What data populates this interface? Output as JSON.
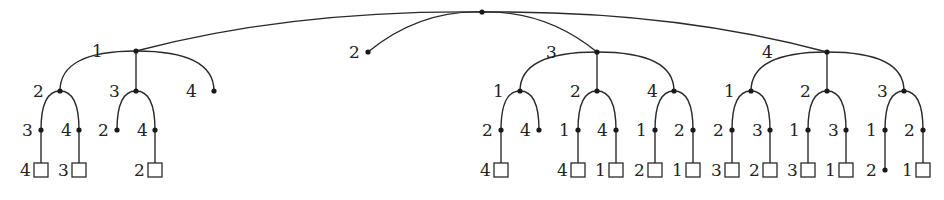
{
  "diagram": {
    "type": "game-tree",
    "style": {
      "line_color": "#2a2a2a",
      "text_color": "#222222",
      "background": "#ffffff"
    },
    "root": {
      "x": 482,
      "y": 12
    },
    "nodes": [
      {
        "id": "n1",
        "parent": "root",
        "label": "1",
        "x": 136,
        "y": 51,
        "kind": "dot",
        "lx": 92,
        "ly": 57
      },
      {
        "id": "n1_2",
        "parent": "n1",
        "label": "2",
        "x": 60,
        "y": 91,
        "kind": "dot",
        "lx": 33,
        "ly": 97
      },
      {
        "id": "n1_2_3",
        "parent": "n1_2",
        "label": "3",
        "x": 41,
        "y": 130,
        "kind": "dot",
        "lx": 22,
        "ly": 136
      },
      {
        "id": "n1_2_3_4",
        "parent": "n1_2_3",
        "label": "4",
        "x": 41,
        "y": 170,
        "kind": "box",
        "lx": 20,
        "ly": 176
      },
      {
        "id": "n1_2_4",
        "parent": "n1_2",
        "label": "4",
        "x": 79,
        "y": 130,
        "kind": "dot",
        "lx": 61,
        "ly": 136
      },
      {
        "id": "n1_2_4_3",
        "parent": "n1_2_4",
        "label": "3",
        "x": 79,
        "y": 170,
        "kind": "box",
        "lx": 58,
        "ly": 176
      },
      {
        "id": "n1_3",
        "parent": "n1",
        "label": "3",
        "x": 136,
        "y": 91,
        "kind": "dot",
        "lx": 109,
        "ly": 97
      },
      {
        "id": "n1_3_2",
        "parent": "n1_3",
        "label": "2",
        "x": 117,
        "y": 130,
        "kind": "dot",
        "lx": 98,
        "ly": 136
      },
      {
        "id": "n1_3_4",
        "parent": "n1_3",
        "label": "4",
        "x": 155,
        "y": 130,
        "kind": "dot",
        "lx": 137,
        "ly": 136
      },
      {
        "id": "n1_3_4_2",
        "parent": "n1_3_4",
        "label": "2",
        "x": 155,
        "y": 170,
        "kind": "box",
        "lx": 134,
        "ly": 176
      },
      {
        "id": "n1_4",
        "parent": "n1",
        "label": "4",
        "x": 214,
        "y": 91,
        "kind": "dot",
        "lx": 186,
        "ly": 97
      },
      {
        "id": "n2",
        "parent": "root",
        "label": "2",
        "x": 368,
        "y": 52,
        "kind": "dot",
        "lx": 349,
        "ly": 58
      },
      {
        "id": "n3",
        "parent": "root",
        "label": "3",
        "x": 597,
        "y": 52,
        "kind": "dot",
        "lx": 546,
        "ly": 58
      },
      {
        "id": "n3_1",
        "parent": "n3",
        "label": "1",
        "x": 520,
        "y": 91,
        "kind": "dot",
        "lx": 493,
        "ly": 97
      },
      {
        "id": "n3_1_2",
        "parent": "n3_1",
        "label": "2",
        "x": 501,
        "y": 130,
        "kind": "dot",
        "lx": 482,
        "ly": 136
      },
      {
        "id": "n3_1_2_4",
        "parent": "n3_1_2",
        "label": "4",
        "x": 501,
        "y": 170,
        "kind": "box",
        "lx": 480,
        "ly": 176
      },
      {
        "id": "n3_1_4",
        "parent": "n3_1",
        "label": "4",
        "x": 539,
        "y": 130,
        "kind": "dot",
        "lx": 520,
        "ly": 136
      },
      {
        "id": "n3_2",
        "parent": "n3",
        "label": "2",
        "x": 597,
        "y": 91,
        "kind": "dot",
        "lx": 570,
        "ly": 97
      },
      {
        "id": "n3_2_1",
        "parent": "n3_2",
        "label": "1",
        "x": 578,
        "y": 130,
        "kind": "dot",
        "lx": 559,
        "ly": 136
      },
      {
        "id": "n3_2_1_4",
        "parent": "n3_2_1",
        "label": "4",
        "x": 578,
        "y": 170,
        "kind": "box",
        "lx": 557,
        "ly": 176
      },
      {
        "id": "n3_2_4",
        "parent": "n3_2",
        "label": "4",
        "x": 616,
        "y": 130,
        "kind": "dot",
        "lx": 597,
        "ly": 136
      },
      {
        "id": "n3_2_4_1",
        "parent": "n3_2_4",
        "label": "1",
        "x": 616,
        "y": 170,
        "kind": "box",
        "lx": 595,
        "ly": 176
      },
      {
        "id": "n3_4",
        "parent": "n3",
        "label": "4",
        "x": 674,
        "y": 91,
        "kind": "dot",
        "lx": 647,
        "ly": 97
      },
      {
        "id": "n3_4_1",
        "parent": "n3_4",
        "label": "1",
        "x": 655,
        "y": 130,
        "kind": "dot",
        "lx": 636,
        "ly": 136
      },
      {
        "id": "n3_4_1_2",
        "parent": "n3_4_1",
        "label": "2",
        "x": 655,
        "y": 170,
        "kind": "box",
        "lx": 634,
        "ly": 176
      },
      {
        "id": "n3_4_2",
        "parent": "n3_4",
        "label": "2",
        "x": 693,
        "y": 130,
        "kind": "dot",
        "lx": 674,
        "ly": 136
      },
      {
        "id": "n3_4_2_1",
        "parent": "n3_4_2",
        "label": "1",
        "x": 693,
        "y": 170,
        "kind": "box",
        "lx": 672,
        "ly": 176
      },
      {
        "id": "n4",
        "parent": "root",
        "label": "4",
        "x": 827,
        "y": 52,
        "kind": "dot",
        "lx": 762,
        "ly": 58
      },
      {
        "id": "n4_1",
        "parent": "n4",
        "label": "1",
        "x": 751,
        "y": 91,
        "kind": "dot",
        "lx": 724,
        "ly": 97
      },
      {
        "id": "n4_1_2",
        "parent": "n4_1",
        "label": "2",
        "x": 732,
        "y": 130,
        "kind": "dot",
        "lx": 713,
        "ly": 136
      },
      {
        "id": "n4_1_2_3",
        "parent": "n4_1_2",
        "label": "3",
        "x": 732,
        "y": 170,
        "kind": "box",
        "lx": 711,
        "ly": 176
      },
      {
        "id": "n4_1_3",
        "parent": "n4_1",
        "label": "3",
        "x": 770,
        "y": 130,
        "kind": "dot",
        "lx": 752,
        "ly": 136
      },
      {
        "id": "n4_1_3_2",
        "parent": "n4_1_3",
        "label": "2",
        "x": 770,
        "y": 170,
        "kind": "box",
        "lx": 749,
        "ly": 176
      },
      {
        "id": "n4_2",
        "parent": "n4",
        "label": "2",
        "x": 827,
        "y": 91,
        "kind": "dot",
        "lx": 800,
        "ly": 97
      },
      {
        "id": "n4_2_1",
        "parent": "n4_2",
        "label": "1",
        "x": 808,
        "y": 130,
        "kind": "dot",
        "lx": 789,
        "ly": 136
      },
      {
        "id": "n4_2_1_3",
        "parent": "n4_2_1",
        "label": "3",
        "x": 808,
        "y": 170,
        "kind": "box",
        "lx": 787,
        "ly": 176
      },
      {
        "id": "n4_2_3",
        "parent": "n4_2",
        "label": "3",
        "x": 846,
        "y": 130,
        "kind": "dot",
        "lx": 828,
        "ly": 136
      },
      {
        "id": "n4_2_3_1",
        "parent": "n4_2_3",
        "label": "1",
        "x": 846,
        "y": 170,
        "kind": "box",
        "lx": 825,
        "ly": 176
      },
      {
        "id": "n4_3",
        "parent": "n4",
        "label": "3",
        "x": 904,
        "y": 91,
        "kind": "dot",
        "lx": 877,
        "ly": 97
      },
      {
        "id": "n4_3_1",
        "parent": "n4_3",
        "label": "1",
        "x": 885,
        "y": 130,
        "kind": "dot",
        "lx": 866,
        "ly": 136
      },
      {
        "id": "n4_3_1_2",
        "parent": "n4_3_1",
        "label": "2",
        "x": 885,
        "y": 170,
        "kind": "dot",
        "lx": 866,
        "ly": 176
      },
      {
        "id": "n4_3_2",
        "parent": "n4_3",
        "label": "2",
        "x": 923,
        "y": 130,
        "kind": "dot",
        "lx": 904,
        "ly": 136
      },
      {
        "id": "n4_3_2_1",
        "parent": "n4_3_2",
        "label": "1",
        "x": 923,
        "y": 170,
        "kind": "box",
        "lx": 902,
        "ly": 176
      }
    ]
  }
}
